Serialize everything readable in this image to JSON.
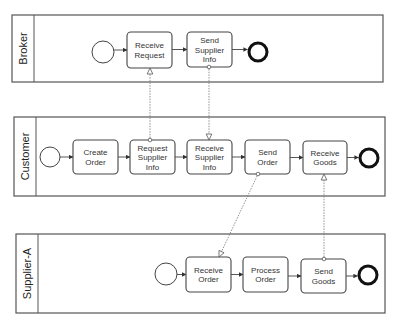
{
  "diagram": {
    "type": "BPMN collaboration",
    "pools": [
      {
        "id": "broker",
        "label": "Broker",
        "x": 12,
        "y": 15,
        "w": 371,
        "h": 67,
        "header_w": 22,
        "start": {
          "cx": 103,
          "cy": 52,
          "r": 11
        },
        "tasks": [
          {
            "id": "receive-request",
            "lines": [
              "Receive",
              "Request"
            ],
            "x": 127,
            "y": 32,
            "w": 45,
            "h": 36
          },
          {
            "id": "send-supplier-info",
            "lines": [
              "Send",
              "Supplier",
              "Info"
            ],
            "x": 187,
            "y": 32,
            "w": 45,
            "h": 35
          }
        ],
        "end": {
          "cx": 258,
          "cy": 52,
          "r": 9
        }
      },
      {
        "id": "customer",
        "label": "Customer",
        "x": 14,
        "y": 117,
        "w": 371,
        "h": 79,
        "header_w": 22,
        "start": {
          "cx": 50,
          "cy": 157,
          "r": 10
        },
        "tasks": [
          {
            "id": "create-order",
            "lines": [
              "Create",
              "Order"
            ],
            "x": 73,
            "y": 140,
            "w": 45,
            "h": 34
          },
          {
            "id": "request-supplier-info",
            "lines": [
              "Request",
              "Supplier",
              "Info"
            ],
            "x": 130,
            "y": 140,
            "w": 45,
            "h": 34
          },
          {
            "id": "receive-supplier-info",
            "lines": [
              "Receive",
              "Supplier",
              "Info"
            ],
            "x": 187,
            "y": 140,
            "w": 45,
            "h": 34
          },
          {
            "id": "send-order",
            "lines": [
              "Send",
              "Order"
            ],
            "x": 245,
            "y": 140,
            "w": 45,
            "h": 34
          },
          {
            "id": "receive-goods",
            "lines": [
              "Receive",
              "Goods"
            ],
            "x": 303,
            "y": 141,
            "w": 44,
            "h": 33
          }
        ],
        "end": {
          "cx": 369,
          "cy": 158,
          "r": 9
        }
      },
      {
        "id": "supplier-a",
        "label": "Supplier-A",
        "x": 16,
        "y": 234,
        "w": 369,
        "h": 79,
        "header_w": 22,
        "start": {
          "cx": 166,
          "cy": 274,
          "r": 11
        },
        "tasks": [
          {
            "id": "receive-order",
            "lines": [
              "Receive",
              "Order"
            ],
            "x": 186,
            "y": 257,
            "w": 45,
            "h": 35
          },
          {
            "id": "process-order",
            "lines": [
              "Process",
              "Order"
            ],
            "x": 243,
            "y": 257,
            "w": 45,
            "h": 35
          },
          {
            "id": "send-goods",
            "lines": [
              "Send",
              "Goods"
            ],
            "x": 301,
            "y": 259,
            "w": 45,
            "h": 34
          }
        ],
        "end": {
          "cx": 368,
          "cy": 275,
          "r": 9
        }
      }
    ],
    "message_flows": [
      {
        "from": "request-supplier-info",
        "to": "receive-request",
        "x1": 150,
        "y1": 140,
        "x2": 150,
        "y2": 68
      },
      {
        "from": "send-supplier-info",
        "to": "receive-supplier-info",
        "x1": 209,
        "y1": 67,
        "x2": 209,
        "y2": 140
      },
      {
        "from": "send-order",
        "to": "receive-order",
        "x1": 258,
        "y1": 174,
        "x2": 219,
        "y2": 257
      },
      {
        "from": "send-goods",
        "to": "receive-goods",
        "x1": 324,
        "y1": 259,
        "x2": 324,
        "y2": 174
      }
    ],
    "colors": {
      "stroke": "#444444",
      "end_event": "#111111",
      "message_flow": "#777777",
      "background": "#ffffff"
    }
  }
}
